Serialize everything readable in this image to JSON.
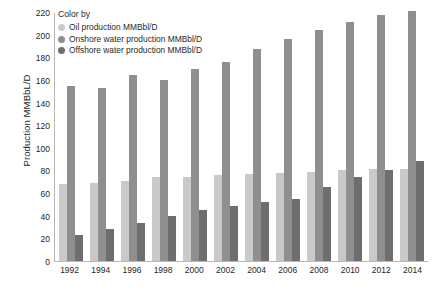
{
  "chart_data": {
    "type": "bar",
    "title": "",
    "xlabel": "",
    "ylabel": "Production MMBbL/D",
    "ylim": [
      0,
      220
    ],
    "yticks": [
      0,
      20,
      40,
      60,
      80,
      100,
      120,
      140,
      160,
      180,
      200,
      220
    ],
    "grid": false,
    "legend_position": "top-left",
    "legend_title": "Color by",
    "categories": [
      "1992",
      "1994",
      "1996",
      "1998",
      "2000",
      "2002",
      "2004",
      "2006",
      "2008",
      "2010",
      "2012",
      "2014"
    ],
    "series": [
      {
        "name": "Oil production MMBbl/D",
        "color": "#c9c9c9",
        "values": [
          68,
          69,
          71,
          74,
          74,
          76,
          77,
          78,
          79,
          80,
          81,
          81
        ]
      },
      {
        "name": "Onshore water production MMBbl/D",
        "color": "#8f8f8f",
        "values": [
          155,
          153,
          164,
          160,
          170,
          176,
          187,
          196,
          204,
          211,
          217,
          221
        ]
      },
      {
        "name": "Offshore water production MMBbl/D",
        "color": "#6e6e6e",
        "values": [
          23,
          28,
          34,
          40,
          45,
          49,
          52,
          55,
          65,
          74,
          80,
          88
        ]
      }
    ]
  },
  "legend": {
    "title": "Color by",
    "items": [
      {
        "label": "Oil production MMBbl/D",
        "color": "#c9c9c9"
      },
      {
        "label": "Onshore  water production MMBbl/D",
        "color": "#8f8f8f"
      },
      {
        "label": "Offshore  water production MMBbl/D",
        "color": "#6e6e6e"
      }
    ]
  },
  "axes": {
    "y_title": "Production MMBbL/D"
  }
}
